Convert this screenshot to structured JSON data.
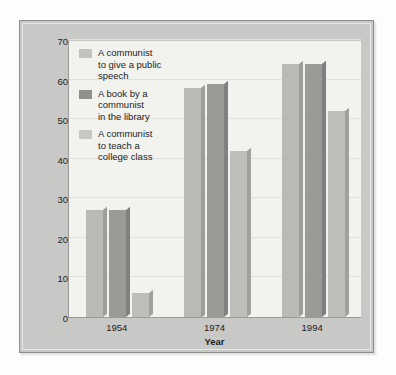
{
  "chart_data": {
    "type": "bar",
    "title": "",
    "xlabel": "Year",
    "ylabel": "Percent of public that would allow:",
    "categories": [
      "1954",
      "1974",
      "1994"
    ],
    "ylim": [
      0,
      70
    ],
    "yticks": [
      0,
      10,
      20,
      30,
      40,
      50,
      60,
      70
    ],
    "ytick_labels": [
      "0",
      "10",
      "20",
      "30",
      "40",
      "50",
      "60",
      "70"
    ],
    "grid": true,
    "legend_position": "inside-top-left",
    "series": [
      {
        "name": "A communist\nto give a public\nspeech",
        "values": [
          27,
          58,
          64
        ],
        "color": "#b9b9b6"
      },
      {
        "name": "A book by a\ncommunist\nin the library",
        "values": [
          27,
          59,
          64
        ],
        "color": "#9a9a97"
      },
      {
        "name": "A communist\nto teach a\ncollege class",
        "values": [
          6,
          42,
          52
        ],
        "color": "#bdbdba"
      }
    ]
  }
}
